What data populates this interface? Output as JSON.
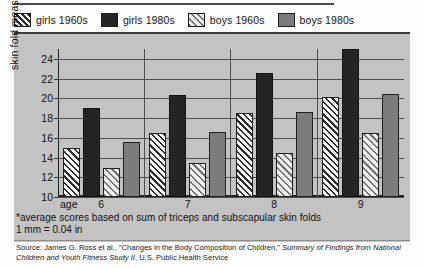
{
  "legend": {
    "items": [
      {
        "label": "girls 1960s",
        "swatch": "hatched-dark-on-white",
        "color": "#ffffff"
      },
      {
        "label": "girls 1980s",
        "swatch": "solid-black",
        "color": "#242424"
      },
      {
        "label": "boys 1960s",
        "swatch": "hatched-grey-on-light",
        "color": "#ededed"
      },
      {
        "label": "boys 1980s",
        "swatch": "solid-grey",
        "color": "#7c7c7c"
      }
    ]
  },
  "axis": {
    "y_title": "skin fold measurement (in mm)",
    "y_ticks": [
      "24",
      "22",
      "20",
      "18",
      "16",
      "14",
      "12",
      "10"
    ],
    "age_label": "age",
    "x_ticks": [
      "6",
      "7",
      "8",
      "9"
    ]
  },
  "notes": {
    "line1": "*average scores based on sum of triceps and subscapular skin folds",
    "line2": "1 mm = 0.04 in"
  },
  "source": {
    "prefix": "Source: James G. Ross et al., “Changes in the Body Composition of Children,” ",
    "italic1": "Summary of Findings from National Children and Youth Fitness Study II",
    "suffix": ", U.S. Public Health Service"
  },
  "chart_data": {
    "type": "bar",
    "title": "",
    "xlabel": "age",
    "ylabel": "skin fold measurement (in mm)",
    "ylim": [
      10,
      25
    ],
    "yticks": [
      10,
      12,
      14,
      16,
      18,
      20,
      22,
      24
    ],
    "grid": true,
    "legend_position": "top",
    "categories": [
      "6",
      "7",
      "8",
      "9"
    ],
    "series": [
      {
        "name": "girls 1960s",
        "values": [
          15.0,
          16.5,
          18.5,
          20.1
        ]
      },
      {
        "name": "girls 1980s",
        "values": [
          19.0,
          20.3,
          22.6,
          25.0
        ]
      },
      {
        "name": "boys 1960s",
        "values": [
          12.9,
          13.4,
          14.5,
          16.5
        ]
      },
      {
        "name": "boys 1980s",
        "values": [
          15.6,
          16.6,
          18.6,
          20.4
        ]
      }
    ],
    "units": "mm",
    "footnote": "*average scores based on sum of triceps and subscapular skin folds; 1 mm = 0.04 in"
  }
}
